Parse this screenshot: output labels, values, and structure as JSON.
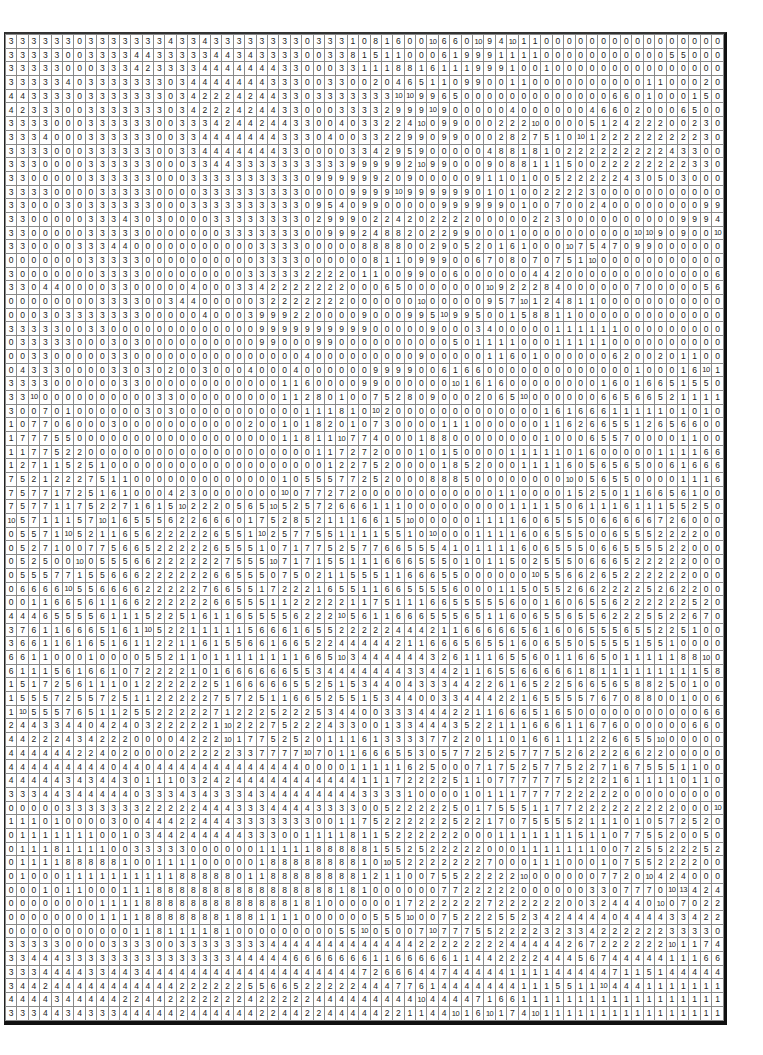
{
  "grid": {
    "rows": 69,
    "cols": 63,
    "cells": [
      "3 3 3 3 3 3 0 3 3 3 3 3 3 3 4 3 3 4 3 3 3 3 3 3 3 3 0 3 3 3 1 0 8 1 6 0 0 10 6 6 0 10 9 4 10 1 1 0 0 0 0 0 0 0 0 0 0 0 0 0 0 0 0",
      "3 3 3 3 3 0 0 3 3 3 3 4 4 3 3 3 3 3 4 4 3 4 3 3 3 3 0 0 3 3 8 1 5 1 1 0 0 0 6 1 9 9 9 1 1 1 1 0 0 0 0 0 0 0 0 0 0 0 5 5 0 0 0",
      "3 3 3 3 3 0 0 0 3 3 3 4 2 3 3 3 3 4 4 4 4 4 4 4 3 3 0 0 0 3 3 1 1 1 8 8 1 6 1 1 1 9 9 9 1 0 0 1 0 0 0 0 0 0 0 0 0 0 0 0 0 0 0",
      "3 3 3 3 3 4 0 3 3 3 3 3 3 3 0 3 4 4 4 4 4 4 4 3 3 3 0 0 3 3 0 0 2 0 4 6 5 1 1 0 9 9 0 0 1 1 0 0 0 0 0 0 0 0 0 0 1 1 0 0 0 2 0",
      "4 4 3 3 3 3 0 3 3 3 3 3 3 3 0 3 4 2 2 2 4 2 4 4 3 3 0 3 3 3 3 3 3 3 10 10 9 9 6 5 0 0 0 0 0 0 0 0 0 0 0 0 0 6 6 0 1 0 0 0 1 5 0",
      "4 2 3 3 3 0 0 3 3 3 3 3 3 3 0 3 4 2 2 2 4 2 4 4 3 3 0 0 0 3 3 3 3 2 9 9 9 10 9 0 0 0 0 0 4 0 0 0 0 0 0 4 6 6 0 2 0 0 0 6 5 0 0",
      "3 3 3 3 0 0 0 3 3 3 3 3 3 0 0 3 3 3 4 2 4 4 2 4 4 3 3 0 0 4 0 3 3 2 2 4 10 0 9 9 0 0 0 2 2 2 10 0 0 0 0 5 1 2 4 2 2 2 0 0 2 3 0",
      "3 3 3 4 0 0 0 3 3 3 3 3 3 0 0 3 3 4 4 4 4 4 4 4 3 3 3 0 4 0 0 3 3 2 2 9 9 0 9 9 0 0 0 2 8 2 7 5 1 0 10 1 2 2 2 2 2 2 2 2 2 3 0",
      "3 3 3 3 0 0 0 3 3 3 3 3 3 0 0 3 3 4 4 4 4 4 4 4 3 3 0 0 0 0 3 3 4 2 9 5 9 0 0 0 0 0 4 8 8 1 8 1 0 2 2 2 2 2 2 2 2 2 4 3 3 0 0",
      "3 3 3 0 0 0 0 3 3 3 3 3 3 0 0 0 3 3 4 4 3 3 3 3 3 3 3 3 3 3 9 9 9 9 9 2 10 9 9 0 0 0 9 0 8 8 1 1 1 5 0 0 2 2 2 2 2 2 2 2 3 3 0",
      "3 3 0 0 0 0 0 3 3 3 3 3 3 0 0 0 3 3 3 3 3 3 3 3 3 3 0 9 9 9 9 9 9 2 0 9 0 0 0 0 0 9 1 1 0 1 0 0 5 2 2 2 2 2 4 3 0 5 0 3 0 0 0",
      "3 3 3 3 0 0 0 0 3 3 3 3 3 0 0 0 0 3 3 3 3 3 3 3 3 3 0 0 0 0 9 9 9 9 10 9 9 9 9 9 9 0 1 0 1 0 0 2 2 2 2 3 0 0 0 0 0 0 0 0 0 0 0",
      "3 3 0 0 0 3 0 3 3 3 3 3 3 0 0 0 3 3 3 3 3 3 3 3 3 3 0 9 5 4 0 9 9 0 0 0 0 0 9 9 9 9 9 9 0 1 0 0 7 0 0 2 4 0 0 0 0 0 0 0 0 9 9",
      "3 3 0 0 0 0 0 3 3 3 4 3 0 3 0 0 0 0 3 3 3 3 3 3 3 3 0 2 9 9 9 0 2 2 4 2 0 2 2 2 2 0 0 0 0 0 2 2 3 0 0 0 0 0 0 0 0 0 0 9 9 9 4",
      "3 3 0 0 0 0 0 3 3 3 3 3 0 0 0 0 0 0 0 3 3 3 3 3 3 3 0 0 9 9 9 2 4 8 8 2 0 2 2 9 9 0 0 0 1 0 0 0 0 0 0 0 0 0 0 10 10 9 0 9 0 0 10",
      "3 3 0 0 0 0 3 3 3 4 4 0 0 0 0 0 0 0 0 0 0 0 3 3 3 3 0 0 0 0 0 8 8 8 8 0 0 2 9 0 5 2 0 1 6 1 0 0 0 10 7 5 4 7 0 9 9 0 0 0 0 0 0",
      "0 0 0 0 0 0 0 3 3 3 3 3 0 0 0 0 0 0 0 0 0 0 3 3 3 3 0 0 0 0 0 0 8 1 1 0 9 9 9 0 0 6 7 0 8 0 7 0 7 5 1 10 0 0 0 0 0 0 0 0 0 0 0",
      "3 0 0 0 0 0 0 0 3 3 3 3 0 0 0 0 0 0 0 0 0 3 3 3 3 3 2 2 2 2 0 1 1 0 0 9 9 0 0 6 0 0 0 0 0 0 4 4 2 0 0 0 0 0 0 0 0 0 0 0 0 0 6",
      "3 3 0 4 4 0 0 0 0 3 3 0 0 0 0 0 4 0 0 0 3 3 4 2 2 2 2 2 2 2 0 0 0 6 5 0 0 0 0 0 0 0 10 9 2 2 2 8 4 0 0 0 0 0 0 7 0 0 0 0 0 5 6",
      "0 0 0 0 0 0 0 0 3 3 3 3 0 0 3 4 4 0 0 0 0 0 3 2 2 2 2 2 2 2 0 0 0 0 0 0 10 0 0 0 0 0 9 5 7 10 1 2 4 8 1 1 0 0 0 0 0 0 0 0 0 0 0",
      "0 0 0 3 0 3 3 3 3 3 3 3 0 0 0 0 0 4 0 0 0 3 9 9 9 2 2 0 0 0 0 9 0 0 0 9 9 5 10 9 9 5 0 0 1 5 8 8 1 1 0 0 0 0 0 0 0 0 0 0 0 0 0",
      "3 3 3 3 3 0 0 3 3 0 0 0 0 0 0 0 0 0 0 0 0 0 9 9 9 9 9 9 9 9 9 9 0 0 0 0 0 9 0 0 0 3 4 0 0 0 0 0 1 1 1 1 1 1 0 0 0 0 0 0 0 0 0",
      "0 3 3 3 3 3 0 0 0 3 0 3 0 0 0 0 0 0 0 0 0 0 9 9 0 0 0 9 9 0 0 0 0 0 0 0 0 0 0 5 0 1 1 1 1 0 0 0 1 1 1 1 1 0 0 0 0 0 0 0 0 0 0",
      "0 0 3 3 0 0 0 0 0 3 3 0 0 0 0 0 0 0 0 0 0 0 0 0 0 0 4 0 0 0 0 0 0 0 0 0 9 0 0 0 0 0 1 1 6 0 1 0 0 0 0 0 0 6 2 0 0 2 0 1 1 0 0",
      "0 4 3 3 3 0 0 0 0 3 3 0 3 0 2 0 0 3 0 0 0 4 0 0 0 4 0 0 0 0 0 0 9 9 9 9 0 0 6 1 6 6 0 0 0 0 0 0 0 0 0 0 0 0 0 1 0 0 0 1 6 10 1",
      "3 3 3 3 0 0 0 0 0 0 3 3 0 0 0 0 0 0 0 0 0 0 0 0 1 1 6 0 0 0 0 9 9 0 0 0 0 0 0 10 1 6 1 6 0 0 0 0 0 0 0 0 1 6 0 1 6 6 5 1 5 5 0",
      "3 3 10 0 0 0 0 0 0 0 0 0 0 3 3 0 0 0 0 0 0 0 0 0 1 1 2 8 0 1 0 0 7 5 2 8 0 9 0 0 0 2 0 6 5 10 0 0 0 0 0 0 6 6 5 6 6 5 2 1 1 1 1",
      "3 0 0 7 0 1 0 0 0 0 0 0 3 0 3 0 0 0 0 0 0 0 0 0 0 0 1 1 1 8 1 0 10 2 0 0 0 0 0 0 0 0 0 0 0 0 0 1 6 1 6 6 6 1 1 1 1 1 0 1 0 1 0",
      "1 0 7 7 0 6 0 0 0 3 0 0 0 0 0 0 0 0 0 0 0 2 0 0 1 0 1 8 2 0 1 0 7 3 0 0 0 0 1 1 1 0 0 0 0 0 0 1 1 6 2 6 6 5 5 1 2 6 5 6 6 0 0",
      "1 7 7 7 5 5 0 0 0 0 0 0 0 0 0 0 0 0 0 0 0 0 0 0 1 1 8 1 1 10 7 7 4 0 0 0 1 8 8 0 0 0 0 0 0 0 0 1 0 0 0 6 5 5 7 0 0 0 0 1 1 0 0",
      "1 1 7 7 5 2 2 0 0 0 0 0 0 0 0 0 0 0 0 0 0 0 0 0 0 0 0 1 1 7 2 7 2 0 0 0 1 0 1 5 0 0 0 0 1 1 1 1 1 0 1 6 0 0 0 0 0 1 1 1 1 6 6",
      "1 2 7 1 1 5 2 5 1 0 0 0 0 0 0 0 0 0 0 0 0 0 0 0 0 0 0 0 1 2 2 7 5 2 0 0 0 0 1 8 5 2 0 0 0 1 1 1 1 6 0 5 6 5 6 5 0 0 6 1 6 6 6",
      "7 5 2 1 2 2 2 7 5 1 1 0 0 0 0 0 0 0 0 0 0 0 0 0 1 0 5 5 5 7 7 2 5 2 0 0 0 8 8 8 5 0 0 0 0 0 0 0 0 10 0 5 6 5 5 0 0 0 0 1 1 1 6",
      "7 5 7 7 1 7 2 5 1 6 1 0 0 0 4 2 3 0 0 0 0 0 0 0 10 0 7 7 2 7 2 0 0 0 0 0 0 0 0 0 0 0 0 1 1 0 0 0 0 1 5 2 5 0 1 1 6 6 5 6 1 0 0",
      "7 5 7 7 1 1 7 5 2 2 7 1 6 1 5 10 2 2 2 0 5 6 5 10 5 2 5 7 2 6 6 6 1 1 1 0 0 0 0 0 0 0 0 0 1 1 1 1 5 0 6 1 1 1 6 1 1 1 5 5 2 5 0",
      "10 5 7 1 1 1 5 7 10 1 6 5 5 5 6 2 2 6 6 6 0 1 7 5 2 8 5 2 1 1 1 6 6 1 5 10 0 0 0 0 0 1 1 1 1 6 0 6 5 5 5 0 6 6 6 6 6 7 2 6 0 0 0",
      "0 5 5 7 1 10 5 2 1 1 6 5 6 2 2 2 2 2 6 5 5 1 10 2 5 7 7 5 5 1 1 1 1 5 5 1 0 10 0 0 0 1 1 1 1 6 0 6 5 5 5 0 0 6 5 5 5 2 2 2 2 0 0",
      "0 5 2 7 1 0 0 7 7 5 6 6 5 2 2 2 2 2 6 5 5 5 1 0 7 1 7 7 5 2 5 7 7 6 6 5 5 5 4 1 0 1 1 1 1 6 0 6 5 5 5 0 6 6 5 5 5 5 2 2 0 0 0",
      "0 5 2 5 0 0 10 0 5 5 5 6 6 2 2 2 2 2 2 7 5 5 5 10 7 1 7 1 5 5 1 1 1 6 6 6 5 5 5 0 1 0 1 1 5 0 2 5 5 5 0 6 6 6 5 2 2 2 2 2 0 0 0",
      "0 5 5 5 7 7 1 5 5 6 6 6 2 2 2 2 2 2 6 6 5 5 5 0 7 5 0 2 1 1 5 5 5 1 1 6 6 6 5 5 0 0 0 0 0 0 10 5 5 6 6 2 6 5 2 2 2 2 2 2 0 0 0",
      "0 6 6 6 6 10 5 5 6 6 6 6 2 2 2 2 2 7 6 6 5 5 1 7 2 2 2 1 6 5 5 1 1 6 6 5 5 5 5 6 0 0 0 1 1 5 0 5 5 2 6 6 2 2 2 2 5 2 6 2 2 0 0",
      "0 0 1 1 6 6 5 6 1 1 6 6 2 2 2 2 2 2 6 6 5 5 5 1 1 2 2 2 2 2 1 1 7 5 1 1 1 6 6 5 5 5 5 5 6 0 0 1 6 0 6 5 5 6 2 2 2 2 2 2 5 2 0",
      "4 4 4 6 5 5 5 5 6 1 1 1 5 2 2 5 1 6 1 1 6 5 5 5 5 6 2 2 2 10 5 6 1 1 6 6 6 5 5 5 6 5 1 1 6 0 6 5 5 6 5 5 6 2 2 2 5 5 2 2 6 7 0",
      "3 7 6 1 1 6 6 6 5 1 6 1 10 5 2 2 1 1 1 1 1 5 6 6 6 1 6 5 5 2 2 2 2 2 4 4 4 2 1 1 6 6 6 6 6 5 6 1 6 0 6 5 5 5 6 5 5 2 2 5 1 0 0",
      "3 6 6 1 1 6 1 6 5 1 6 1 1 2 2 1 1 6 1 5 5 6 6 1 6 6 5 2 2 4 4 4 4 4 2 1 1 6 6 6 5 6 5 5 1 6 0 6 5 5 0 5 5 5 5 1 5 5 1 0 0 0 0",
      "6 6 1 1 0 0 0 1 0 0 0 0 5 5 2 1 1 0 1 1 1 1 1 1 1 1 6 6 5 10 3 4 4 4 4 4 4 3 2 6 1 1 1 6 5 5 6 0 1 1 6 6 5 0 1 1 1 1 1 8 8 10 0",
      "6 1 1 1 5 6 1 6 6 1 0 7 2 2 2 2 1 0 1 6 6 6 6 6 6 5 5 3 4 4 4 4 4 4 4 3 3 4 4 2 1 1 6 5 5 6 6 6 6 6 1 8 1 1 1 1 1 1 1 1 1 5 8",
      "1 5 1 7 2 5 6 1 1 1 0 1 2 2 2 2 2 2 5 1 6 6 6 6 6 5 5 2 5 1 5 3 4 4 0 4 3 3 3 4 4 2 2 6 1 6 5 2 2 5 6 6 5 6 5 8 8 2 5 0 1 0 0",
      "1 5 5 5 7 2 5 5 7 2 5 1 1 2 2 2 2 2 7 5 7 2 5 1 1 6 6 5 2 5 5 1 5 3 4 4 0 0 3 3 4 4 4 2 2 1 6 5 5 5 5 7 6 7 0 8 8 0 0 1 0 0 6",
      "1 10 5 5 5 7 6 5 1 1 2 5 5 2 2 2 2 2 7 1 2 2 2 5 2 2 2 5 3 4 4 0 0 3 3 3 4 4 4 2 2 1 1 6 6 6 5 1 6 5 0 0 0 0 0 0 0 0 0 0 0 6 6",
      "2 4 4 3 3 4 4 0 4 2 4 0 3 2 2 2 2 2 1 10 2 2 2 7 5 2 2 2 4 3 3 0 0 1 3 3 4 4 4 3 5 2 2 1 1 1 6 6 6 1 1 6 7 6 0 0 0 0 0 0 6 6 0",
      "4 4 2 2 2 4 3 4 2 2 2 0 0 0 0 4 2 2 2 10 1 7 7 5 2 5 2 0 1 1 1 6 1 3 3 3 3 7 7 2 2 0 1 1 0 1 6 6 1 1 1 2 2 6 6 5 5 10 0 0 0 0 0",
      "4 4 4 4 4 4 2 2 4 0 2 0 0 0 0 2 2 2 2 2 3 3 7 7 7 7 10 7 0 1 1 6 6 6 5 5 3 0 5 7 7 2 5 2 5 7 7 7 5 2 6 2 2 2 6 6 2 2 0 0 0 0 0",
      "4 4 4 4 4 4 4 4 4 0 4 4 0 4 4 4 4 4 4 4 4 4 4 4 4 4 0 0 0 0 1 1 1 1 1 6 2 5 0 0 0 7 1 7 5 2 5 7 7 5 2 2 7 1 6 7 5 5 5 1 1 0 0",
      "4 4 4 4 4 3 4 3 4 4 3 0 1 1 1 0 3 2 4 2 4 4 4 4 4 4 4 4 4 4 4 1 1 1 7 2 2 2 2 5 1 1 0 7 7 7 7 7 7 5 2 2 2 1 6 1 1 1 1 0 1 1 0",
      "3 3 3 4 4 3 4 4 4 4 4 0 3 3 3 4 3 4 3 3 3 4 3 4 4 4 4 4 4 4 4 3 3 3 3 1 0 0 0 0 1 0 1 1 1 7 7 7 7 2 2 2 2 2 0 0 0 0 0 0 0 0 0",
      "0 0 0 0 0 3 3 3 3 3 3 3 2 2 2 2 2 4 4 4 3 3 3 4 4 4 4 3 3 3 3 0 0 5 2 2 2 2 2 5 0 1 7 5 5 5 1 1 7 7 2 2 2 2 2 2 2 2 2 0 0 0 10",
      "1 1 1 0 1 0 0 0 0 3 0 0 4 4 4 2 2 4 4 4 3 3 3 3 3 3 3 0 0 1 1 7 5 2 2 2 2 2 2 5 2 2 1 7 0 7 5 5 5 5 2 1 1 1 0 1 0 5 7 2 5 2 0 0 0",
      "0 1 1 1 1 1 1 1 0 0 1 0 3 4 4 2 4 4 4 4 4 3 3 3 0 0 1 1 1 1 8 1 1 5 2 2 2 2 2 2 0 0 0 1 1 1 1 1 1 1 5 1 1 0 7 7 5 5 2 0 0 5 0",
      "0 1 1 1 8 1 1 1 1 0 0 3 3 3 3 3 0 0 0 0 0 0 1 1 1 1 1 8 8 8 8 8 1 5 5 2 5 2 2 2 2 2 0 0 0 1 1 1 1 1 1 1 0 0 7 2 5 5 2 2 2 5 2",
      "0 1 1 1 1 8 8 8 8 8 1 0 0 1 1 1 1 0 0 0 0 0 1 8 8 8 8 8 8 8 8 1 0 10 5 2 2 2 2 2 2 2 7 0 0 0 1 1 1 0 0 0 1 0 7 5 5 2 2 2 2 0 0",
      "0 1 0 0 0 1 1 1 1 1 1 1 1 1 1 8 8 8 8 8 0 1 1 8 8 8 8 8 8 8 8 1 2 1 1 0 0 7 5 5 2 2 2 2 2 10 0 0 0 0 0 0 7 7 2 0 10 4 2 4 0 0 0",
      "0 0 0 1 0 1 1 0 0 0 1 1 1 8 8 8 8 8 8 8 8 8 8 8 8 8 8 8 8 1 8 1 0 0 0 0 0 0 7 7 2 2 2 2 2 0 0 0 0 0 0 3 3 0 7 7 7 0 10 13 4 2 4",
      "0 0 0 0 0 0 0 0 1 1 1 1 8 8 8 8 8 8 8 8 8 8 8 8 8 1 8 1 0 0 0 0 0 0 1 7 2 2 2 2 2 2 7 2 2 2 2 2 2 0 0 3 2 4 4 4 0 10 0 7 0 2 2",
      "0 0 0 0 0 0 0 0 1 1 1 1 8 8 8 8 8 8 8 1 8 8 1 1 1 1 0 0 0 0 0 0 5 5 5 10 0 0 7 5 2 2 2 5 5 2 3 4 2 4 4 4 4 0 4 4 4 4 3 3 4 2 2",
      "0 0 0 0 0 0 0 0 0 0 0 1 1 8 1 1 1 1 8 1 0 0 0 0 0 0 0 0 0 5 5 10 0 5 0 0 7 10 7 7 7 5 5 2 2 2 2 3 2 3 3 4 2 2 2 2 2 2 3 3 3 3 0",
      "3 3 3 3 3 0 0 0 0 3 3 3 3 0 0 3 3 3 3 3 3 3 3 4 4 4 4 4 4 4 4 4 4 4 4 4 2 2 2 2 2 2 2 2 4 4 4 4 4 2 6 7 2 2 2 2 2 2 10 1 1 7 4",
      "3 3 4 4 4 3 3 3 3 3 3 3 3 3 3 3 3 3 3 3 4 4 4 4 4 6 6 6 6 6 6 6 1 1 6 6 6 6 6 1 1 4 4 2 2 2 2 4 4 4 5 6 7 4 4 4 4 4 1 1 1 6 6",
      "3 3 3 4 4 4 4 3 3 4 4 3 4 4 4 4 4 4 4 4 4 4 4 4 4 4 4 4 4 4 4 7 2 6 6 6 4 4 7 4 4 4 4 4 1 1 1 1 4 4 4 4 4 7 1 1 5 1 4 4 4 4 4",
      "3 4 4 2 4 4 4 4 4 4 4 4 4 4 4 2 2 2 2 2 2 5 5 6 6 5 2 2 2 2 2 4 4 4 7 7 6 1 4 4 4 4 4 4 4 1 1 1 5 5 1 1 10 4 4 4 1 1 1 1 1 1 1",
      "4 4 4 4 3 4 4 4 4 4 2 2 4 4 2 2 2 2 2 2 2 4 2 2 2 2 2 4 4 4 4 4 4 4 4 4 10 4 4 4 4 7 1 6 6 1 1 1 1 1 1 1 1 1 1 1 1 1 1 1 1 1 1",
      "3 3 3 4 4 3 4 3 3 3 4 4 4 4 4 2 4 4 4 4 4 4 2 2 4 4 2 2 4 4 4 4 4 2 2 1 1 4 4 10 1 6 10 1 7 4 10 1 1 1 1 1 1 1 1 1 1 1 1 1 1 1 1"
    ]
  }
}
